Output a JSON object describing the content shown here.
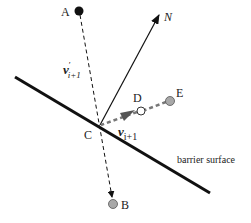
{
  "diagram": {
    "colors": {
      "line": "#111111",
      "point_filled": "#111111",
      "point_gray": "#a8a8a8",
      "point_open": "#ffffff",
      "dashed_gray": "#8a8a8a"
    },
    "points": {
      "A": {
        "label": "A",
        "x": 79,
        "y": 11,
        "style": "filled-black"
      },
      "B": {
        "label": "B",
        "x": 113,
        "y": 204,
        "style": "gray"
      },
      "C": {
        "label": "C",
        "x": 100,
        "y": 125,
        "style": "none"
      },
      "D": {
        "label": "D",
        "x": 141,
        "y": 111,
        "style": "open"
      },
      "E": {
        "label": "E",
        "x": 170,
        "y": 101,
        "style": "gray"
      }
    },
    "vectors": {
      "normal": {
        "label": "N",
        "from": "C",
        "to": [
          160,
          14
        ]
      },
      "incoming": {
        "label_main": "v",
        "label_prime": "′",
        "label_sub": "i+1",
        "from": "A",
        "to": "B",
        "style": "dashed"
      },
      "reflected": {
        "label_main": "v",
        "label_sub": "i+1",
        "from": "E",
        "to": "C",
        "style": "thick-dashed-gray"
      }
    },
    "barrier": {
      "label": "barrier surface",
      "from": [
        15,
        77
      ],
      "to": [
        210,
        193
      ]
    }
  }
}
